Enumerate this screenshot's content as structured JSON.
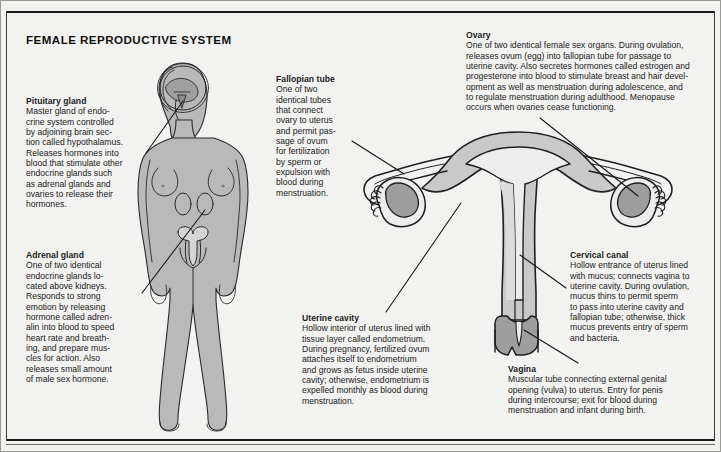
{
  "page": {
    "title": "FEMALE REPRODUCTIVE SYSTEM",
    "background_color": "#f2f2f0",
    "ink_color": "#1b1b1b",
    "organ_fill_light": "#c6c6c6",
    "organ_fill_mid": "#b0b0b0",
    "organ_fill_dark": "#8f8f8f",
    "body_fill": "#b9b9b9"
  },
  "callouts": {
    "pituitary": {
      "heading": "Pituitary gland",
      "body": "Master gland of endo-\ncrine system controlled\nby adjoining brain sec-\ntion called hypothalamus.\nReleases hormones into\nblood that stimulate other\nendocrine glands such\nas adrenal glands and\novaries to release their\nhormones."
    },
    "adrenal": {
      "heading": "Adrenal gland",
      "body": "One of two identical\nendocrine glands lo-\ncated above kidneys.\nResponds to strong\nemotion by releasing\nhormone called adren-\nalin into blood to speed\nheart rate and breath-\ning, and prepare mus-\ncles for action. Also\nreleases small amount\nof male sex hormone."
    },
    "fallopian": {
      "heading": "Fallopian tube",
      "body": "One of two\nidentical tubes\nthat connect\novary to uterus\nand permit pas-\nsage of ovum\nfor fertilization\nby sperm or\nexpulsion with\nblood during\nmenstruation."
    },
    "uterine_cavity": {
      "heading": "Uterine cavity",
      "body": "Hollow interior of uterus lined with\ntissue layer called endometrium.\nDuring pregnancy, fertilized ovum\nattaches itself to endometrium\nand grows as fetus inside uterine\ncavity; otherwise, endometrium is\nexpelled monthly as blood during\nmenstruation."
    },
    "ovary": {
      "heading": "Ovary",
      "body": "One of two identical female sex organs. During ovulation,\nreleases ovum (egg) into fallopian tube for passage to\nuterine cavity. Also secretes hormones called estrogen and\nprogesterone into blood to stimulate breast and hair devel-\nopment as well as menstruation during adolescence, and\nto regulate menstruation during adulthood. Menopause\noccurs when ovaries cease functioning."
    },
    "cervical_canal": {
      "heading": "Cervical canal",
      "body": "Hollow entrance of uterus lined\nwith mucus; connects vagina to\nuterine cavity. During ovulation,\nmucus thins to permit sperm\nto pass into uterine cavity and\nfallopian tube; otherwise, thick\nmucus prevents entry of sperm\nand bacteria."
    },
    "vagina": {
      "heading": "Vagina",
      "body": "Muscular tube connecting external genital\nopening (vulva) to uterus. Entry for penis\nduring intercourse; exit for blood during\nmenstruation and infant during birth."
    }
  },
  "figures": {
    "woman": {
      "name": "female-body-figure",
      "features": [
        "head",
        "brain-outline",
        "pituitary-gland",
        "torso",
        "breasts",
        "arms",
        "legs",
        "adrenal-glands",
        "uterus-inset"
      ]
    },
    "uterus": {
      "name": "uterus-cross-section",
      "features": [
        "left-fallopian-tube",
        "right-fallopian-tube",
        "left-ovary",
        "right-ovary",
        "left-fimbriae",
        "right-fimbriae",
        "uterine-cavity",
        "uterine-wall",
        "cervical-canal",
        "cervix",
        "vagina"
      ]
    }
  }
}
